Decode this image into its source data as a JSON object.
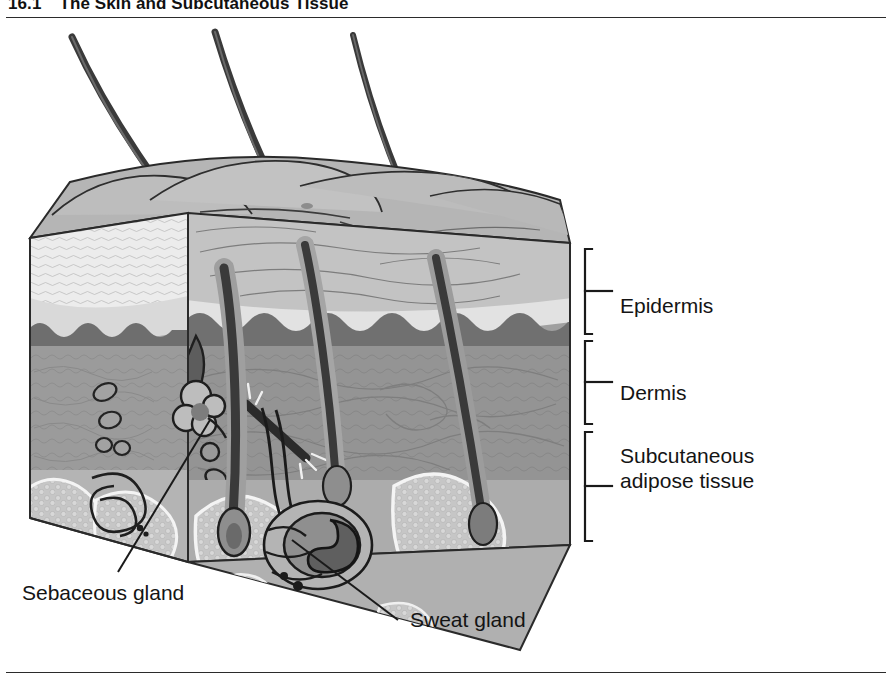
{
  "figure": {
    "number": "16.1",
    "title": "The Skin and Subcutaneous Tissue",
    "type": "anatomical-illustration",
    "style": "grayscale cut-away block diagram of skin"
  },
  "bracket_labels": [
    {
      "id": "epidermis",
      "text": "Epidermis"
    },
    {
      "id": "dermis",
      "text": "Dermis"
    },
    {
      "id": "subcutaneous",
      "text": "Subcutaneous adipose tissue"
    }
  ],
  "leader_labels": [
    {
      "id": "sebaceous",
      "text": "Sebaceous gland"
    },
    {
      "id": "sweat",
      "text": "Sweat gland"
    }
  ],
  "colors": {
    "ink": "#1a1a1a",
    "rule": "#2b2b2b",
    "epidermis_top": "#b9b9b9",
    "epidermis_band": "#eaeaea",
    "dermis": "#9a9a9a",
    "dermis_dark": "#7e7e7e",
    "fat_lobule": "#c2c2c2",
    "fat_outline": "#f2f2f2",
    "hair": "#3a3a3a",
    "outline": "#2a2a2a"
  }
}
